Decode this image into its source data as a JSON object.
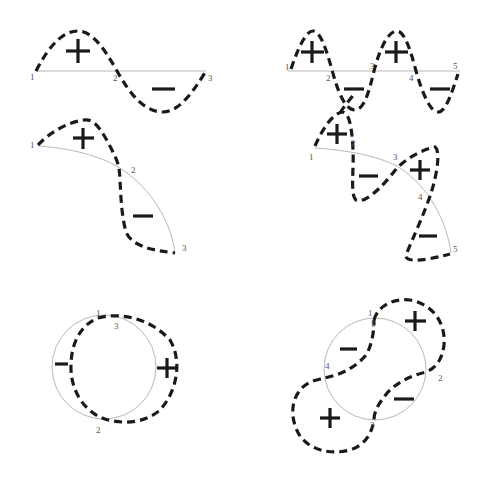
{
  "figure": {
    "panels": [
      {
        "id": "line-one-wave",
        "shape": "straight line",
        "nodes": [
          "1",
          "2",
          "3"
        ],
        "lobes": [
          {
            "sign": "+"
          },
          {
            "sign": "−"
          }
        ]
      },
      {
        "id": "line-two-waves",
        "shape": "straight line",
        "nodes": [
          "1",
          "2",
          "3",
          "4",
          "5"
        ],
        "lobes": [
          {
            "sign": "+"
          },
          {
            "sign": "−"
          },
          {
            "sign": "+"
          },
          {
            "sign": "−"
          }
        ]
      },
      {
        "id": "arc-one-wave",
        "shape": "arc",
        "nodes": [
          "1",
          "2",
          "3"
        ],
        "lobes": [
          {
            "sign": "+"
          },
          {
            "sign": "−"
          }
        ]
      },
      {
        "id": "arc-two-waves",
        "shape": "arc",
        "nodes": [
          "1",
          "2",
          "3",
          "4",
          "5"
        ],
        "lobes": [
          {
            "sign": "+"
          },
          {
            "sign": "−"
          },
          {
            "sign": "+"
          },
          {
            "sign": "−"
          }
        ]
      },
      {
        "id": "ring-one-wave",
        "shape": "circle",
        "nodes": [
          "1",
          "2",
          "3"
        ],
        "lobes": [
          {
            "sign": "−"
          },
          {
            "sign": "+"
          }
        ]
      },
      {
        "id": "ring-two-waves",
        "shape": "circle",
        "nodes": [
          "1",
          "2",
          "3",
          "4",
          "5"
        ],
        "lobes": [
          {
            "sign": "+"
          },
          {
            "sign": "−"
          },
          {
            "sign": "+"
          },
          {
            "sign": "−"
          }
        ]
      }
    ]
  },
  "colors": {
    "guide": "#b8b8b8",
    "wave": "#1a1a1a",
    "label": "#555555",
    "background": "#ffffff"
  }
}
